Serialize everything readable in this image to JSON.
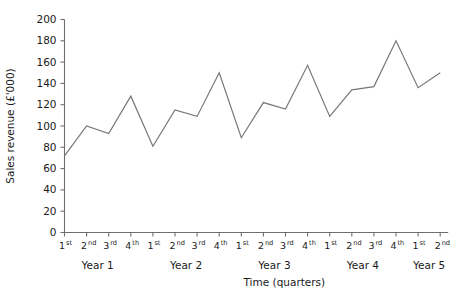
{
  "chart_data": {
    "type": "line",
    "title": "",
    "xlabel": "Time (quarters)",
    "ylabel": "Sales revenue (£'000)",
    "ylim": [
      0,
      200
    ],
    "ytick_step": 20,
    "yticks": [
      0,
      20,
      40,
      60,
      80,
      100,
      120,
      140,
      160,
      180,
      200
    ],
    "ytick_labels": [
      "0",
      "20",
      "40",
      "60",
      "80",
      "100",
      "120",
      "140",
      "160",
      "180",
      "200"
    ],
    "grid": false,
    "legend": null,
    "line_color": "#777777",
    "axis_color": "#6e6e6e",
    "categories": [
      "1st",
      "2nd",
      "3rd",
      "4th",
      "1st",
      "2nd",
      "3rd",
      "4th",
      "1st",
      "2nd",
      "3rd",
      "4th",
      "1st",
      "2nd",
      "3rd",
      "4th",
      "1st",
      "2nd"
    ],
    "quarter_ordinals": [
      {
        "num": "1",
        "sup": "st"
      },
      {
        "num": "2",
        "sup": "nd"
      },
      {
        "num": "3",
        "sup": "rd"
      },
      {
        "num": "4",
        "sup": "th"
      },
      {
        "num": "1",
        "sup": "st"
      },
      {
        "num": "2",
        "sup": "nd"
      },
      {
        "num": "3",
        "sup": "rd"
      },
      {
        "num": "4",
        "sup": "th"
      },
      {
        "num": "1",
        "sup": "st"
      },
      {
        "num": "2",
        "sup": "nd"
      },
      {
        "num": "3",
        "sup": "rd"
      },
      {
        "num": "4",
        "sup": "th"
      },
      {
        "num": "1",
        "sup": "st"
      },
      {
        "num": "2",
        "sup": "nd"
      },
      {
        "num": "3",
        "sup": "rd"
      },
      {
        "num": "4",
        "sup": "th"
      },
      {
        "num": "1",
        "sup": "st"
      },
      {
        "num": "2",
        "sup": "nd"
      }
    ],
    "year_groups": [
      {
        "label": "Year 1",
        "start_index": 0,
        "end_index": 3
      },
      {
        "label": "Year 2",
        "start_index": 4,
        "end_index": 7
      },
      {
        "label": "Year 3",
        "start_index": 8,
        "end_index": 11
      },
      {
        "label": "Year 4",
        "start_index": 12,
        "end_index": 15
      },
      {
        "label": "Year 5",
        "start_index": 16,
        "end_index": 17
      }
    ],
    "values": [
      72,
      100,
      93,
      128,
      81,
      115,
      109,
      150,
      89,
      122,
      116,
      157,
      109,
      134,
      137,
      180,
      136,
      150
    ]
  }
}
